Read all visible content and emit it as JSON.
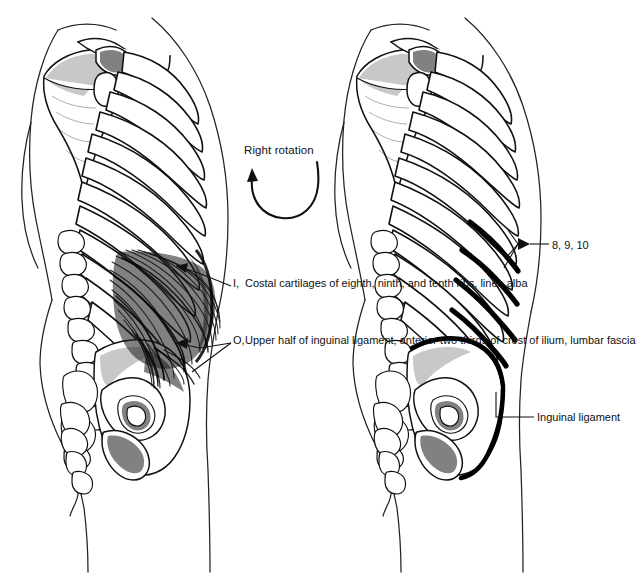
{
  "figure": {
    "title_visible": false,
    "background_color": "#ffffff",
    "ink_color": "#111111",
    "panels": [
      {
        "id": "left",
        "name": "external-abdominal-oblique-muscle-view",
        "description": "Posterolateral view of torso skeleton with external abdominal oblique muscle shown as dark striated fibers"
      },
      {
        "id": "right",
        "name": "skeletal-attachment-view",
        "description": "Posterolateral view of torso skeleton showing bony attachment sites"
      }
    ]
  },
  "annotations": {
    "rotation": {
      "label": "Right rotation",
      "icon": "curved-arrow-counterclockwise"
    },
    "insertion": {
      "key": "I,",
      "text": "Costal cartilages of eighth, ninth, and tenth ribs, linea alba"
    },
    "origin": {
      "key": "O,",
      "text": "Upper half of inguinal ligament, anterior two thirds of crest of ilium, lumbar fascia"
    },
    "ribs": {
      "label": "8, 9, 10"
    },
    "inguinal": {
      "label": "Inguinal ligament"
    }
  }
}
